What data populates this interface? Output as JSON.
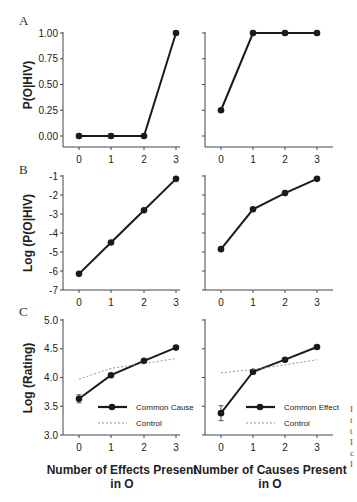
{
  "figure": {
    "panel_labels": [
      "A",
      "B",
      "C"
    ],
    "edge_fragments": [
      "I",
      "t",
      "t",
      "I",
      "c",
      "I"
    ]
  },
  "chart_data": [
    {
      "id": "A-left",
      "panel": "A",
      "type": "line",
      "ylabel": "P(O|HIV)",
      "xlabel": "",
      "x": [
        0,
        1,
        2,
        3
      ],
      "xticks": [
        "0",
        "1",
        "2",
        "3"
      ],
      "yticks": [
        "0.00",
        "0.25",
        "0.50",
        "0.75",
        "1.00"
      ],
      "ylim": [
        0,
        1
      ],
      "grid": false,
      "series": [
        {
          "name": "P(O|HIV)",
          "values": [
            0.0,
            0.0,
            0.0,
            1.0
          ]
        }
      ]
    },
    {
      "id": "A-right",
      "panel": "A",
      "type": "line",
      "ylabel": "",
      "xlabel": "",
      "x": [
        0,
        1,
        2,
        3
      ],
      "xticks": [
        "0",
        "1",
        "2",
        "3"
      ],
      "ylim": [
        0,
        1
      ],
      "grid": false,
      "series": [
        {
          "name": "P(O|HIV)",
          "values": [
            0.25,
            1.0,
            1.0,
            1.0
          ]
        }
      ]
    },
    {
      "id": "B-left",
      "panel": "B",
      "type": "line",
      "ylabel": "Log (P(O|HIV)",
      "xlabel": "",
      "x": [
        0,
        1,
        2,
        3
      ],
      "xticks": [
        "0",
        "1",
        "2",
        "3"
      ],
      "yticks": [
        "-7",
        "-6",
        "-5",
        "-4",
        "-3",
        "-2",
        "-1"
      ],
      "ylim": [
        -7,
        -1
      ],
      "grid": false,
      "series": [
        {
          "name": "Log P(O|HIV)",
          "values": [
            -6.15,
            -4.5,
            -2.8,
            -1.15
          ]
        }
      ]
    },
    {
      "id": "B-right",
      "panel": "B",
      "type": "line",
      "ylabel": "",
      "xlabel": "",
      "x": [
        0,
        1,
        2,
        3
      ],
      "xticks": [
        "0",
        "1",
        "2",
        "3"
      ],
      "ylim": [
        -7,
        -1
      ],
      "grid": false,
      "series": [
        {
          "name": "Log P(O|HIV)",
          "values": [
            -4.85,
            -2.75,
            -1.9,
            -1.15
          ]
        }
      ]
    },
    {
      "id": "C-left",
      "panel": "C",
      "type": "line",
      "ylabel": "Log (Rating)",
      "xlabel": "Number of Effects Present in O",
      "x": [
        0,
        1,
        2,
        3
      ],
      "xticks": [
        "0",
        "1",
        "2",
        "3"
      ],
      "yticks": [
        "3.0",
        "3.5",
        "4.0",
        "4.5",
        "5.0"
      ],
      "ylim": [
        3.0,
        5.0
      ],
      "grid": false,
      "legend_position": "lower right",
      "series": [
        {
          "name": "Common Cause",
          "values": [
            3.63,
            4.04,
            4.29,
            4.52
          ],
          "errors": [
            0.07,
            0.02,
            0.02,
            0.02
          ],
          "style": "solid-marker"
        },
        {
          "name": "Control",
          "values": [
            3.97,
            4.16,
            4.24,
            4.33
          ],
          "style": "dashed"
        }
      ]
    },
    {
      "id": "C-right",
      "panel": "C",
      "type": "line",
      "ylabel": "",
      "xlabel": "Number of Causes Present in O",
      "x": [
        0,
        1,
        2,
        3
      ],
      "xticks": [
        "0",
        "1",
        "2",
        "3"
      ],
      "ylim": [
        3.0,
        5.0
      ],
      "grid": false,
      "legend_position": "lower right",
      "series": [
        {
          "name": "Common Effect",
          "values": [
            3.38,
            4.1,
            4.31,
            4.53
          ],
          "errors": [
            0.13,
            0.04,
            0.02,
            0.02
          ],
          "style": "solid-marker"
        },
        {
          "name": "Control",
          "values": [
            4.08,
            4.14,
            4.22,
            4.31
          ],
          "style": "dashed"
        }
      ]
    }
  ],
  "labels": {
    "A_ylabel": "P(O|HIV)",
    "B_ylabel": "Log (P(O|HIV)",
    "C_ylabel": "Log (Rating)",
    "C_left_xlabel_line1": "Number of Effects Present",
    "C_left_xlabel_line2": "in O",
    "C_right_xlabel_line1": "Number of Causes Present",
    "C_right_xlabel_line2": "in O",
    "legend_left_main": "Common Cause",
    "legend_right_main": "Common Effect",
    "legend_control": "Control"
  }
}
